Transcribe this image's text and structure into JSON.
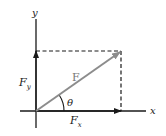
{
  "diagram": {
    "labels": {
      "y_axis": "y",
      "x_axis": "x",
      "force": "F",
      "force_y": "F",
      "force_y_sub": "y",
      "force_x": "F",
      "force_x_sub": "x",
      "angle": "θ"
    },
    "colors": {
      "axes": "#1a1a1a",
      "force_vector": "#8c8c8c",
      "dashed": "#1a1a1a",
      "background": "#ffffff"
    }
  }
}
